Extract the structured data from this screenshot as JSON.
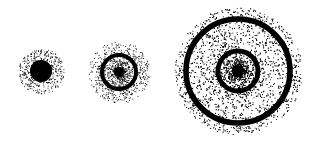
{
  "background": "#ffffff",
  "ink": "#000000",
  "width": 320,
  "height": 143,
  "orbitals": [
    {
      "name": "1s",
      "cx": 41,
      "cy": 71,
      "outer_radius": 23,
      "core": {
        "radius": 11
      },
      "rings": [],
      "dots": 700
    },
    {
      "name": "2s",
      "cx": 119,
      "cy": 72,
      "outer_radius": 31,
      "core": {
        "radius": 5
      },
      "rings": [
        {
          "radius": 17,
          "width": 5
        }
      ],
      "dots": 1100
    },
    {
      "name": "3s",
      "cx": 238,
      "cy": 71,
      "outer_radius": 64,
      "core": {
        "radius": 6
      },
      "rings": [
        {
          "radius": 20,
          "width": 6
        },
        {
          "radius": 52,
          "width": 7
        }
      ],
      "dots": 4200
    }
  ]
}
